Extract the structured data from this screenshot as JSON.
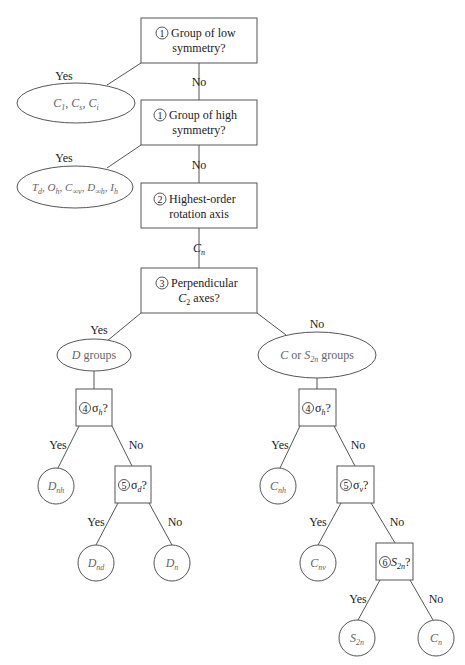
{
  "diagram": {
    "questions": {
      "q1_low": {
        "step": "1",
        "line1": "Group of low",
        "line2": "symmetry?"
      },
      "q1_high": {
        "step": "1",
        "line1": "Group of high",
        "line2": "symmetry?"
      },
      "q2": {
        "step": "2",
        "line1": "Highest-order",
        "line2": "rotation axis"
      },
      "q3": {
        "step": "3",
        "line1": "Perpendicular",
        "line2_main": "C",
        "line2_sub": "2",
        "line2_rest": " axes?"
      },
      "q4_left": {
        "step": "4",
        "sym": "σ",
        "sub": "h",
        "tail": "?"
      },
      "q4_right": {
        "step": "4",
        "sym": "σ",
        "sub": "h",
        "tail": "?"
      },
      "q5_left": {
        "step": "5",
        "sym": "σ",
        "sub": "d",
        "tail": "?"
      },
      "q5_right": {
        "step": "5",
        "sym": "σ",
        "sub": "v",
        "tail": "?"
      },
      "q6": {
        "step": "6",
        "sym": "S",
        "sub": "2n",
        "tail": "?"
      }
    },
    "edge_labels": {
      "yes": "Yes",
      "no": "No",
      "cn_main": "C",
      "cn_sub": "n"
    },
    "results": {
      "low": [
        {
          "main": "C",
          "sub": "1"
        },
        {
          "main": "C",
          "sub": "s"
        },
        {
          "main": "C",
          "sub": "i"
        }
      ],
      "high": [
        {
          "main": "T",
          "sub": "d"
        },
        {
          "main": "O",
          "sub": "h"
        },
        {
          "main": "C",
          "sub": "∞v"
        },
        {
          "main": "D",
          "sub": "∞h"
        },
        {
          "main": "I",
          "sub": "h"
        }
      ],
      "d_groups": {
        "main": "D",
        "rest": " groups"
      },
      "c_groups": {
        "main": "C",
        "mid": " or ",
        "main2": "S",
        "sub2": "2n",
        "rest": " groups"
      },
      "Dnh": {
        "main": "D",
        "sub": "nh"
      },
      "Dnd": {
        "main": "D",
        "sub": "nd"
      },
      "Dn": {
        "main": "D",
        "sub": "n"
      },
      "Cnh": {
        "main": "C",
        "sub": "nh"
      },
      "Cnv": {
        "main": "C",
        "sub": "nv"
      },
      "S2n": {
        "main": "S",
        "sub": "2n"
      },
      "Cn": {
        "main": "C",
        "sub": "n"
      }
    },
    "colors": {
      "line": "#555555",
      "text": "#222222",
      "result_text": "#666666"
    }
  }
}
